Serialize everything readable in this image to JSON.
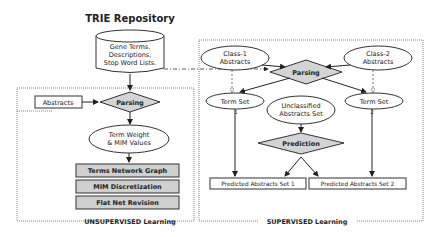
{
  "title": "TRIE Repository",
  "repository": {
    "lines": [
      "Gene Terms,",
      "Descriptions,",
      "Stop Word Lists."
    ]
  },
  "unsupervised": {
    "label": "UNSUPERVISED Learning",
    "abstracts": "Abstracts",
    "parsing": "Parsing",
    "term_weight": [
      "Term Weight",
      "& MIM Values"
    ],
    "steps": [
      "Terms Network Graph",
      "MIM Discretization",
      "Flat Net Revision"
    ]
  },
  "supervised": {
    "label": "SUPERVISED Learning",
    "class1": [
      "Class-1",
      "Abstracts"
    ],
    "class2": [
      "Class-2",
      "Abstracts"
    ],
    "parsing": "Parsing",
    "term_set_1": "Term Set",
    "term_set_1_num": "1",
    "term_set_2": "Term Set",
    "term_set_2_num": "2",
    "unclassified": [
      "Unclassified",
      "Abstracts Set"
    ],
    "prediction": "Prediction",
    "predicted_1": "Predicted Abstracts Set 1",
    "predicted_2": "Predicted Abstracts Set 2"
  },
  "colors": {
    "diamond_fill": "#d4d4d4",
    "step_fill": "#d0d0d0",
    "stroke": "#333333"
  }
}
